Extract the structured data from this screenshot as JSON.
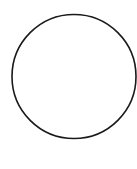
{
  "canvas": {
    "width": 137,
    "height": 169,
    "background": "#ffffff"
  },
  "shapes": [
    {
      "type": "circle",
      "cx": 74,
      "cy": 76.5,
      "r": 62,
      "stroke": "#1a1a1a",
      "stroke_width": 1.6,
      "fill": "none"
    }
  ]
}
